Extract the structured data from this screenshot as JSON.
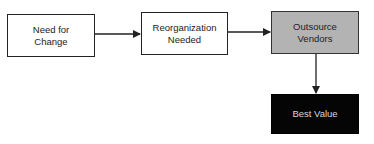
{
  "diagram": {
    "type": "flowchart",
    "nodes": [
      {
        "id": "n1",
        "label": "Need for\nChange",
        "fill": "#ffffff",
        "text_color": "#222222"
      },
      {
        "id": "n2",
        "label": "Reorganization\nNeeded",
        "fill": "#ffffff",
        "text_color": "#222222"
      },
      {
        "id": "n3",
        "label": "Outsource\nVendors",
        "fill": "#b3b3b3",
        "text_color": "#222222"
      },
      {
        "id": "n4",
        "label": "Best Value",
        "fill": "#050505",
        "text_color": "#d8d8d8"
      }
    ],
    "edges": [
      {
        "from": "n1",
        "to": "n2"
      },
      {
        "from": "n2",
        "to": "n3"
      },
      {
        "from": "n3",
        "to": "n4"
      }
    ]
  }
}
